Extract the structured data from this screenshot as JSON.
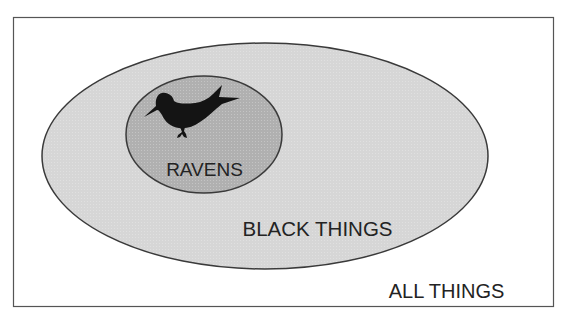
{
  "diagram": {
    "type": "euler-diagram",
    "colors": {
      "frame_stroke": "#555555",
      "outer_fill": "#d6d6d6",
      "inner_fill": "#b0b0b0",
      "ellipse_stroke": "#3a3a3a",
      "raven_fill": "#141414",
      "text": "#232323"
    },
    "sets": [
      {
        "id": "all",
        "label": "ALL THINGS"
      },
      {
        "id": "black",
        "label": "BLACK THINGS"
      },
      {
        "id": "ravens",
        "label": "RAVENS",
        "icon": "raven-icon"
      }
    ]
  }
}
